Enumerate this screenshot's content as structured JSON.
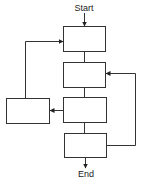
{
  "diagram": {
    "type": "flowchart",
    "start_label": "Start",
    "end_label": "End",
    "colors": {
      "stroke": "#333333",
      "fill": "#ffffff",
      "text": "#222222"
    },
    "nodes": [
      {
        "id": "box1",
        "label": "",
        "x": 63,
        "y": 26,
        "w": 42,
        "h": 25
      },
      {
        "id": "box2",
        "label": "",
        "x": 63,
        "y": 62,
        "w": 42,
        "h": 25
      },
      {
        "id": "box3",
        "label": "",
        "x": 63,
        "y": 97,
        "w": 43,
        "h": 25
      },
      {
        "id": "box4",
        "label": "",
        "x": 64,
        "y": 133,
        "w": 42,
        "h": 24
      },
      {
        "id": "box_left",
        "label": "",
        "x": 6,
        "y": 98,
        "w": 43,
        "h": 25
      }
    ],
    "edges": [
      {
        "from": "start",
        "to": "box1"
      },
      {
        "from": "box1",
        "to": "box2"
      },
      {
        "from": "box2",
        "to": "box3"
      },
      {
        "from": "box3",
        "to": "box4"
      },
      {
        "from": "box3",
        "to": "box_left"
      },
      {
        "from": "box_left",
        "to": "box1"
      },
      {
        "from": "box4",
        "to": "box2"
      },
      {
        "from": "box4",
        "to": "end"
      }
    ]
  }
}
